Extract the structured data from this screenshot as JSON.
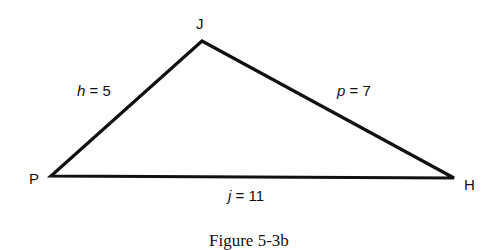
{
  "figure": {
    "caption": "Figure 5-3b",
    "vertices": {
      "J": {
        "label": "J",
        "x": 202,
        "y": 41
      },
      "P": {
        "label": "P",
        "x": 51,
        "y": 176
      },
      "H": {
        "label": "H",
        "x": 454,
        "y": 178
      }
    },
    "sides": {
      "h": {
        "var": "h",
        "eq": " = 5",
        "value": 5,
        "between": [
          "P",
          "J"
        ]
      },
      "p": {
        "var": "p",
        "eq": " = 7",
        "value": 7,
        "between": [
          "J",
          "H"
        ]
      },
      "j": {
        "var": "j",
        "eq": " = 11",
        "value": 11,
        "between": [
          "P",
          "H"
        ]
      }
    },
    "stroke_color": "#111111"
  }
}
